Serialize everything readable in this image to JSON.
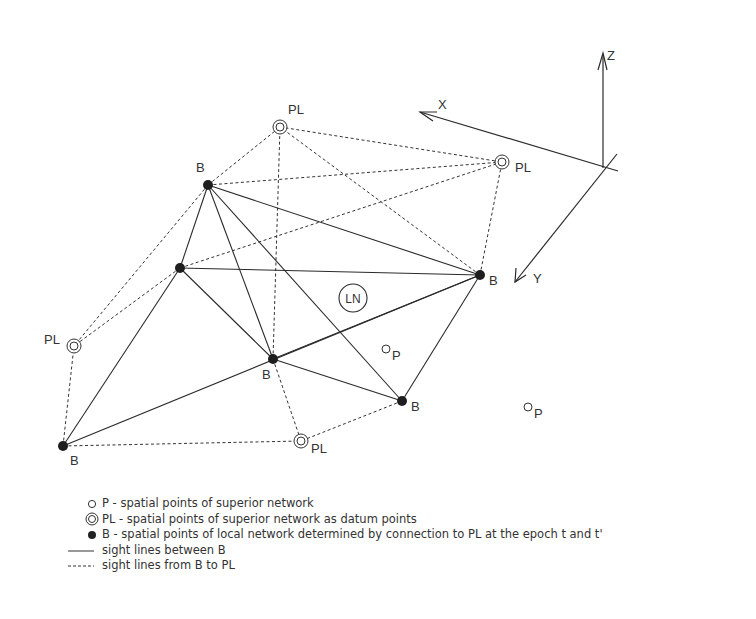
{
  "diagram": {
    "network_label": "LN",
    "axes": {
      "x_label": "X",
      "y_label": "Y",
      "z_label": "Z"
    },
    "points": {
      "B": [
        {
          "id": "B1",
          "x": 208,
          "y": 185,
          "label": "B",
          "label_pos": [
            196,
            172
          ]
        },
        {
          "id": "B2",
          "x": 180,
          "y": 268,
          "label": "",
          "label_pos": null
        },
        {
          "id": "B3",
          "x": 480,
          "y": 275,
          "label": "B",
          "label_pos": [
            489,
            285
          ]
        },
        {
          "id": "B4",
          "x": 273,
          "y": 359,
          "label": "B",
          "label_pos": [
            262,
            379
          ]
        },
        {
          "id": "B5",
          "x": 402,
          "y": 401,
          "label": "B",
          "label_pos": [
            411,
            411
          ]
        },
        {
          "id": "B6",
          "x": 63,
          "y": 446,
          "label": "B",
          "label_pos": [
            70,
            465
          ]
        }
      ],
      "PL": [
        {
          "id": "PL1",
          "x": 280,
          "y": 127,
          "label": "PL",
          "label_pos": [
            288,
            114
          ]
        },
        {
          "id": "PL2",
          "x": 502,
          "y": 162,
          "label": "PL",
          "label_pos": [
            515,
            172
          ]
        },
        {
          "id": "PL3",
          "x": 74,
          "y": 346,
          "label": "PL",
          "label_pos": [
            44,
            344
          ]
        },
        {
          "id": "PL4",
          "x": 301,
          "y": 441,
          "label": "PL",
          "label_pos": [
            311,
            453
          ]
        }
      ],
      "P": [
        {
          "id": "P1",
          "x": 386,
          "y": 349,
          "label": "P"
        },
        {
          "id": "P2",
          "x": 528,
          "y": 407,
          "label": "P"
        }
      ]
    },
    "sight_lines_between_B": [
      [
        "B1",
        "B2"
      ],
      [
        "B1",
        "B3"
      ],
      [
        "B1",
        "B4"
      ],
      [
        "B1",
        "B5"
      ],
      [
        "B2",
        "B3"
      ],
      [
        "B2",
        "B4"
      ],
      [
        "B2",
        "B6"
      ],
      [
        "B3",
        "B5"
      ],
      [
        "B3",
        "B4"
      ],
      [
        "B3",
        "B6"
      ],
      [
        "B4",
        "B5"
      ]
    ],
    "sight_lines_B_to_PL": [
      [
        "B1",
        "PL1"
      ],
      [
        "B1",
        "PL2"
      ],
      [
        "B1",
        "PL3"
      ],
      [
        "B2",
        "PL2"
      ],
      [
        "B2",
        "PL3"
      ],
      [
        "B3",
        "PL1"
      ],
      [
        "B3",
        "PL2"
      ],
      [
        "B4",
        "PL1"
      ],
      [
        "B4",
        "PL4"
      ],
      [
        "B5",
        "PL4"
      ],
      [
        "B6",
        "PL3"
      ],
      [
        "B6",
        "PL4"
      ],
      [
        "PL1",
        "PL2"
      ]
    ]
  },
  "legend": {
    "items": [
      {
        "symbol": "open-circle",
        "text": "P - spatial points of superior network"
      },
      {
        "symbol": "double-circle",
        "text": "PL - spatial points of superior network as datum points"
      },
      {
        "symbol": "filled-circle",
        "text": "B - spatial points of local network determined by connection to PL at the epoch t and t'"
      },
      {
        "symbol": "solid-line",
        "text": "sight lines between B"
      },
      {
        "symbol": "dashed-line",
        "text": "sight lines from B to PL"
      }
    ]
  },
  "colors": {
    "ink": "#2a2a2a",
    "background": "#ffffff"
  }
}
